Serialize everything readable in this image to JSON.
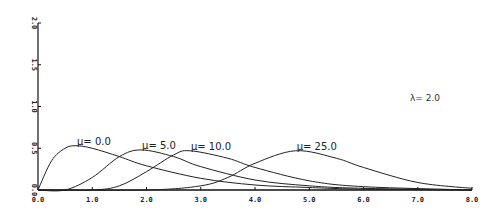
{
  "chart_data": {
    "type": "line",
    "title": "",
    "xlabel": "",
    "ylabel": "",
    "xlim": [
      0,
      8
    ],
    "ylim": [
      0,
      2
    ],
    "grid": false,
    "x_ticks": [
      "0.0",
      "1.0",
      "2.0",
      "3.0",
      "4.0",
      "5.0",
      "6.0",
      "7.0",
      "8.0"
    ],
    "y_ticks": [
      "0.0",
      "0.5",
      "1.0",
      "1.5",
      "2.0"
    ],
    "annotation": "λ= 2.0",
    "series": [
      {
        "name": "μ= 0.0",
        "peak_x": 0.7,
        "peak_y": 0.53,
        "x": [
          0,
          0.25,
          0.5,
          0.7,
          1.0,
          1.5,
          2.0,
          3.0,
          4.0,
          5.0,
          6.0,
          8.0
        ],
        "values": [
          0,
          0.35,
          0.5,
          0.53,
          0.5,
          0.4,
          0.29,
          0.14,
          0.06,
          0.03,
          0.01,
          0.0
        ]
      },
      {
        "name": "μ= 5.0",
        "peak_x": 1.9,
        "peak_y": 0.48,
        "x": [
          0,
          0.5,
          1.0,
          1.5,
          1.9,
          2.5,
          3.0,
          4.0,
          5.0,
          6.0,
          8.0
        ],
        "values": [
          0,
          0.0,
          0.15,
          0.4,
          0.48,
          0.4,
          0.28,
          0.12,
          0.05,
          0.02,
          0.0
        ]
      },
      {
        "name": "μ= 10.0",
        "peak_x": 2.8,
        "peak_y": 0.47,
        "x": [
          0,
          1.0,
          1.5,
          2.0,
          2.5,
          2.8,
          3.5,
          4.0,
          5.0,
          6.0,
          8.0
        ],
        "values": [
          0,
          0.0,
          0.05,
          0.22,
          0.42,
          0.47,
          0.38,
          0.27,
          0.11,
          0.04,
          0.0
        ]
      },
      {
        "name": "μ= 25.0",
        "peak_x": 4.75,
        "peak_y": 0.47,
        "x": [
          0,
          2.0,
          3.0,
          3.5,
          4.0,
          4.75,
          5.5,
          6.0,
          7.0,
          8.0
        ],
        "values": [
          0,
          0.0,
          0.05,
          0.15,
          0.32,
          0.47,
          0.38,
          0.27,
          0.09,
          0.02
        ]
      }
    ]
  }
}
